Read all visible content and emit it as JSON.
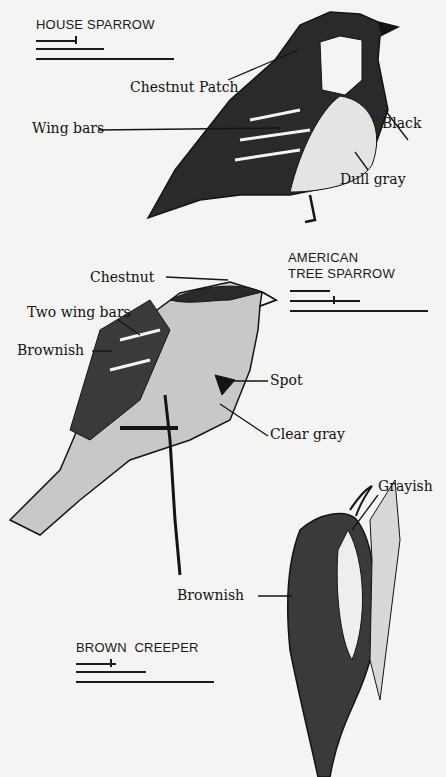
{
  "birds": [
    {
      "name": "HOUSE SPARROW",
      "labels": [
        "Chestnut Patch",
        "Wing bars",
        "Black",
        "Dull gray"
      ]
    },
    {
      "name_line1": "AMERICAN",
      "name_line2": "TREE SPARROW",
      "labels": [
        "Chestnut",
        "Two wing bars",
        "Brownish",
        "Spot",
        "Clear gray"
      ]
    },
    {
      "name": "BROWN  CREEPER",
      "labels": [
        "Grayish",
        "Brownish"
      ]
    }
  ],
  "colors": {
    "ink": "#141414",
    "paper": "#f4f4f2"
  }
}
